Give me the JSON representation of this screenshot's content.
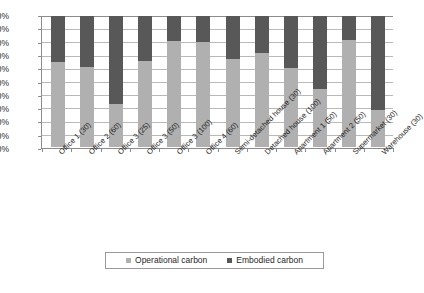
{
  "chart_data": {
    "type": "bar",
    "stacked": true,
    "stack_mode": "percent",
    "title": "",
    "subtitle": "",
    "xlabel": "",
    "ylabel": "",
    "ylim": [
      0,
      100
    ],
    "yticks": [
      "0%",
      "10%",
      "20%",
      "30%",
      "40%",
      "50%",
      "60%",
      "70%",
      "80%",
      "90%",
      "100%"
    ],
    "ytick_values": [
      0,
      10,
      20,
      30,
      40,
      50,
      60,
      70,
      80,
      90,
      100
    ],
    "grid": true,
    "legend_position": "bottom",
    "categories": [
      "Office 1 (30)",
      "Office 2 (60)",
      "Office 3 (25)",
      "Office 3 (50)",
      "Office 3 (100)",
      "Office 4 (60)",
      "Semi-detached house (30)",
      "Detached house (100)",
      "Apartment 1 (50)",
      "Apartment 2 (50)",
      "Supermarket (30)",
      "Warehouse (30)"
    ],
    "series": [
      {
        "name": "Operational carbon",
        "color": "#b0b0b0",
        "values": [
          65,
          61,
          33,
          66,
          81,
          80,
          67,
          72,
          60,
          44,
          82,
          28
        ]
      },
      {
        "name": "Embodied carbon",
        "color": "#585858",
        "values": [
          35,
          39,
          67,
          34,
          19,
          20,
          33,
          28,
          40,
          56,
          18,
          72
        ]
      }
    ]
  },
  "legend": {
    "items": [
      {
        "label": "Operational carbon",
        "swatch": "operational-swatch"
      },
      {
        "label": "Embodied carbon",
        "swatch": "embodied-swatch"
      }
    ]
  }
}
